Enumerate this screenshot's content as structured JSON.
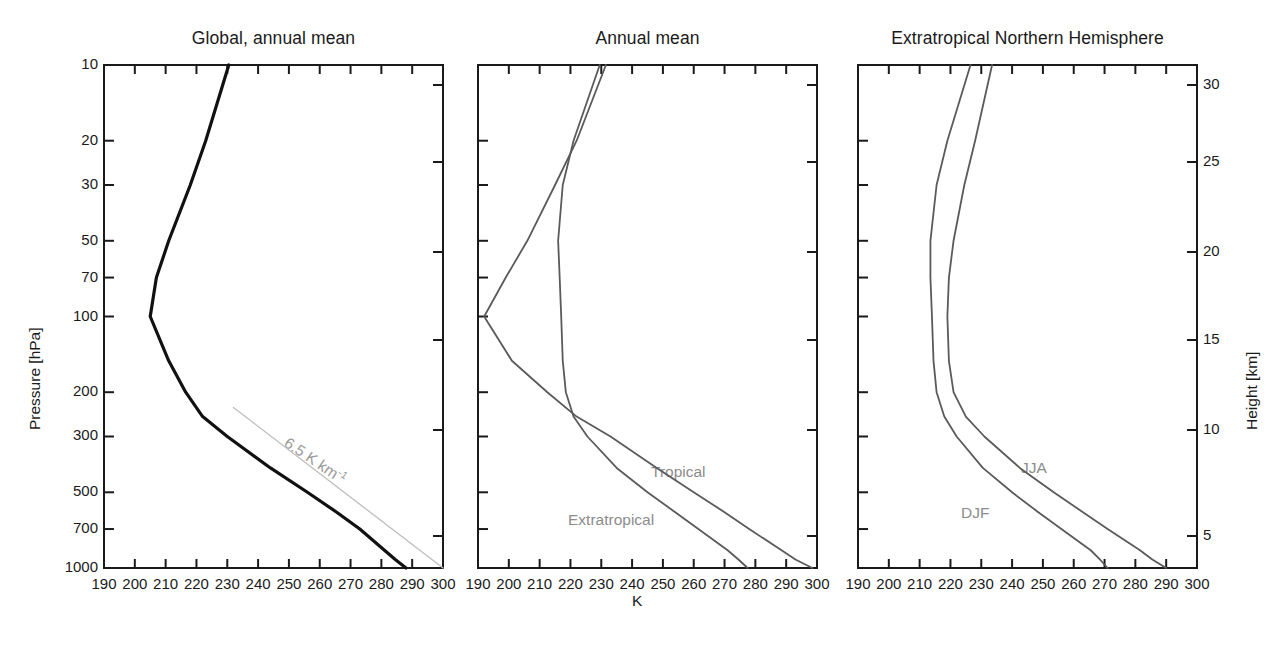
{
  "figure": {
    "background": "#ffffff",
    "curve_color_primary": "#111111",
    "curve_color_secondary": "#5a5a5a",
    "label_color": "#8c8c8c",
    "reference_line_color": "#bdbdbd",
    "clipped_top_text": "",
    "clipped_bottom_text": ""
  },
  "axes": {
    "y_left_label": "Pressure [hPa]",
    "y_left_ticks": [
      1000,
      700,
      500,
      300,
      200,
      100,
      70,
      50,
      30,
      20,
      10
    ],
    "y_left_tick_labels": [
      "1000",
      "700",
      "500",
      "300",
      "200",
      "100",
      "70",
      "50",
      "30",
      "20",
      "10"
    ],
    "y_right_label": "Height [km]",
    "y_right_ticks": [
      5,
      10,
      15,
      20,
      25,
      30
    ],
    "y_right_tick_labels": [
      "5",
      "10",
      "15",
      "20",
      "25",
      "30"
    ],
    "x_label": "K",
    "x_ticks": [
      190,
      200,
      210,
      220,
      230,
      240,
      250,
      260,
      270,
      280,
      290,
      300
    ],
    "x_tick_labels": [
      "190",
      "200",
      "210",
      "220",
      "230",
      "240",
      "250",
      "260",
      "270",
      "280",
      "290",
      "300"
    ],
    "xlim": [
      190,
      300
    ],
    "ylim_pressure": [
      1000,
      10
    ],
    "y_scale": "log"
  },
  "panels": [
    {
      "id": "global-annual-mean",
      "title": "Global, annual mean"
    },
    {
      "id": "annual-mean",
      "title": "Annual mean"
    },
    {
      "id": "extratropical-nh",
      "title": "Extratropical Northern Hemisphere"
    }
  ],
  "annotations": {
    "lapse_rate": "6.5 K km",
    "lapse_rate_exponent": "-1",
    "tropical": "Tropical",
    "extratropical": "Extratropical",
    "jja": "JJA",
    "djf": "DJF"
  },
  "chart_data": {
    "type": "line",
    "xlabel": "K",
    "ylabel": "Pressure [hPa]",
    "ylabel_right": "Height [km]",
    "xlim": [
      190,
      300
    ],
    "ylim": [
      1000,
      10
    ],
    "yscale": "log",
    "grid": false,
    "legend": "inline-labels",
    "panels": [
      {
        "title": "Global, annual mean",
        "series": [
          {
            "name": "Global annual mean temperature",
            "color": "#111111",
            "width": 3.2,
            "pressure_hPa": [
              1000,
              925,
              850,
              700,
              600,
              500,
              400,
              300,
              250,
              200,
              150,
              100,
              70,
              50,
              30,
              20,
              10
            ],
            "temperature_K": [
              288.0,
              284.5,
              281.0,
              273.0,
              265.5,
              256.0,
              244.0,
              230.0,
              222.0,
              216.5,
              211.0,
              205.0,
              207.0,
              211.0,
              218.0,
              223.0,
              230.5
            ]
          },
          {
            "name": "6.5 K km-1 reference lapse rate",
            "color": "#bdbdbd",
            "width": 1.3,
            "pressure_hPa": [
              1000,
              230
            ],
            "temperature_K": [
              300.0,
              232.0
            ]
          }
        ]
      },
      {
        "title": "Annual mean",
        "series": [
          {
            "name": "Tropical",
            "color": "#5a5a5a",
            "width": 1.8,
            "pressure_hPa": [
              1000,
              925,
              850,
              700,
              600,
              500,
              400,
              300,
              250,
              200,
              150,
              100,
              70,
              50,
              30,
              20,
              10
            ],
            "temperature_K": [
              298.5,
              293.0,
              288.5,
              278.0,
              270.0,
              260.0,
              248.0,
              233.0,
              222.0,
              212.5,
              201.0,
              192.0,
              199.0,
              206.0,
              215.0,
              222.0,
              231.5
            ]
          },
          {
            "name": "Extratropical",
            "color": "#5a5a5a",
            "width": 1.8,
            "pressure_hPa": [
              1000,
              925,
              850,
              700,
              600,
              500,
              400,
              300,
              250,
              200,
              150,
              100,
              70,
              50,
              30,
              20,
              10
            ],
            "temperature_K": [
              277.5,
              274.5,
              271.0,
              261.5,
              254.0,
              245.0,
              235.0,
              225.5,
              221.0,
              218.5,
              217.5,
              217.0,
              216.5,
              216.0,
              217.5,
              221.0,
              229.5
            ]
          }
        ]
      },
      {
        "title": "Extratropical Northern Hemisphere",
        "series": [
          {
            "name": "JJA",
            "color": "#5a5a5a",
            "width": 1.8,
            "pressure_hPa": [
              1000,
              925,
              850,
              700,
              600,
              500,
              400,
              300,
              250,
              200,
              150,
              100,
              70,
              50,
              30,
              20,
              10
            ],
            "temperature_K": [
              290.0,
              285.5,
              281.5,
              271.0,
              263.0,
              253.5,
              242.5,
              231.0,
              225.0,
              221.0,
              219.5,
              219.0,
              219.5,
              221.0,
              224.5,
              228.0,
              233.5
            ]
          },
          {
            "name": "DJF",
            "color": "#5a5a5a",
            "width": 1.8,
            "pressure_hPa": [
              1000,
              925,
              850,
              700,
              600,
              500,
              400,
              300,
              250,
              200,
              150,
              100,
              70,
              50,
              30,
              20,
              10
            ],
            "temperature_K": [
              271.0,
              268.5,
              265.5,
              256.0,
              248.5,
              240.0,
              230.5,
              222.0,
              218.0,
              215.5,
              214.5,
              214.0,
              213.5,
              213.5,
              215.5,
              219.0,
              226.5
            ]
          }
        ]
      }
    ]
  }
}
